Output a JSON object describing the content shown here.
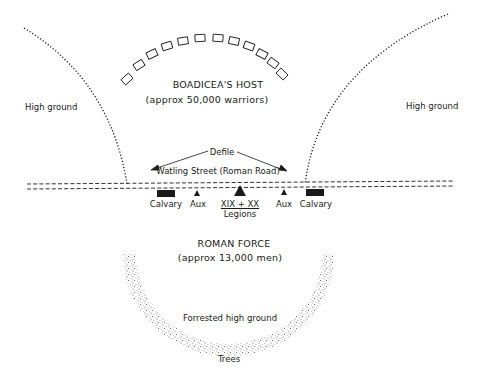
{
  "diagram": {
    "labels": {
      "high_ground_left": "High ground",
      "high_ground_right": "High ground",
      "host_title": "BOADICEA'S HOST",
      "host_size": "(approx 50,000 warriors)",
      "defile": "Defile",
      "road": "Watling Street (Roman Road)",
      "calvary_left": "Calvary",
      "aux_left": "Aux",
      "legions_numerals": "XIX + XX",
      "legions": "Legions",
      "aux_right": "Aux",
      "calvary_right": "Calvary",
      "roman_title": "ROMAN FORCE",
      "roman_size": "(approx 13,000 men)",
      "forest": "Forrested high ground",
      "trees": "Trees"
    },
    "colors": {
      "ink": "#1a1a1a",
      "stipple": "#555555",
      "background": "#ffffff"
    }
  }
}
